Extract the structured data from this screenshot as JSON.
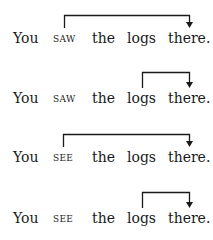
{
  "diagram": {
    "title": "",
    "ink_color": "#1a1a1a",
    "examples": [
      {
        "words": [
          {
            "text": "You",
            "small_caps": false
          },
          {
            "text": "saw",
            "small_caps": true
          },
          {
            "text": "the",
            "small_caps": false
          },
          {
            "text": "logs",
            "small_caps": false
          },
          {
            "text": "there.",
            "small_caps": false
          }
        ],
        "arrow": {
          "from_word": 1,
          "to_word": 4,
          "from_label": "saw",
          "to_label": "there."
        }
      },
      {
        "words": [
          {
            "text": "You",
            "small_caps": false
          },
          {
            "text": "saw",
            "small_caps": true
          },
          {
            "text": "the",
            "small_caps": false
          },
          {
            "text": "logs",
            "small_caps": false
          },
          {
            "text": "there.",
            "small_caps": false
          }
        ],
        "arrow": {
          "from_word": 3,
          "to_word": 4,
          "from_label": "logs",
          "to_label": "there."
        }
      },
      {
        "words": [
          {
            "text": "You",
            "small_caps": false
          },
          {
            "text": "see",
            "small_caps": true
          },
          {
            "text": "the",
            "small_caps": false
          },
          {
            "text": "logs",
            "small_caps": false
          },
          {
            "text": "there.",
            "small_caps": false
          }
        ],
        "arrow": {
          "from_word": 1,
          "to_word": 4,
          "from_label": "see",
          "to_label": "there."
        }
      },
      {
        "words": [
          {
            "text": "You",
            "small_caps": false
          },
          {
            "text": "see",
            "small_caps": true
          },
          {
            "text": "the",
            "small_caps": false
          },
          {
            "text": "logs",
            "small_caps": false
          },
          {
            "text": "there.",
            "small_caps": false
          }
        ],
        "arrow": {
          "from_word": 3,
          "to_word": 4,
          "from_label": "logs",
          "to_label": "there."
        }
      }
    ]
  }
}
